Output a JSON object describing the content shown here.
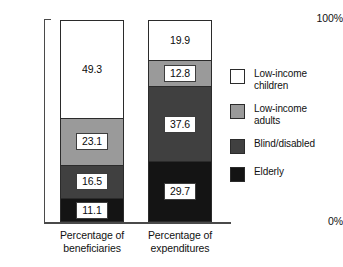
{
  "chart_data": {
    "type": "bar",
    "subtype": "stacked-100-percent",
    "title": "",
    "xlabel": "",
    "ylabel": "",
    "ylim": [
      0,
      100
    ],
    "ytick_labels": [
      "0%",
      "100%"
    ],
    "grid": false,
    "legend_position": "right",
    "categories": [
      "Percentage of beneficiaries",
      "Percentage of expenditures"
    ],
    "series": [
      {
        "name": "Low-income children",
        "color": "#ffffff",
        "values": [
          49.3,
          19.9
        ]
      },
      {
        "name": "Low-income adults",
        "color": "#9a9a9a",
        "values": [
          23.1,
          12.8
        ]
      },
      {
        "name": "Blind/disabled",
        "color": "#404040",
        "values": [
          16.5,
          37.6
        ]
      },
      {
        "name": "Elderly",
        "color": "#141414",
        "values": [
          11.1,
          29.7
        ]
      }
    ]
  },
  "axis": {
    "y_top_label": "100%",
    "y_bottom_label": "0%"
  },
  "bars": {
    "beneficiaries": {
      "category_label": "Percentage of\nbeneficiaries",
      "segments": [
        {
          "label": "Low-income children",
          "value": "49.3",
          "size": 49.3,
          "color": "#ffffff"
        },
        {
          "label": "Low-income adults",
          "value": "23.1",
          "size": 23.1,
          "color": "#9a9a9a"
        },
        {
          "label": "Blind/disabled",
          "value": "16.5",
          "size": 16.5,
          "color": "#404040"
        },
        {
          "label": "Elderly",
          "value": "11.1",
          "size": 11.1,
          "color": "#141414"
        }
      ]
    },
    "expenditures": {
      "category_label": "Percentage of\nexpenditures",
      "segments": [
        {
          "label": "Low-income children",
          "value": "19.9",
          "size": 19.9,
          "color": "#ffffff"
        },
        {
          "label": "Low-income adults",
          "value": "12.8",
          "size": 12.8,
          "color": "#9a9a9a"
        },
        {
          "label": "Blind/disabled",
          "value": "37.6",
          "size": 37.6,
          "color": "#404040"
        },
        {
          "label": "Elderly",
          "value": "29.7",
          "size": 29.7,
          "color": "#141414"
        }
      ]
    }
  },
  "legend": {
    "items": [
      {
        "label": "Low-income\nchildren",
        "color": "#ffffff"
      },
      {
        "label": "Low-income\nadults",
        "color": "#9a9a9a"
      },
      {
        "label": "Blind/disabled",
        "color": "#404040"
      },
      {
        "label": "Elderly",
        "color": "#141414"
      }
    ]
  }
}
